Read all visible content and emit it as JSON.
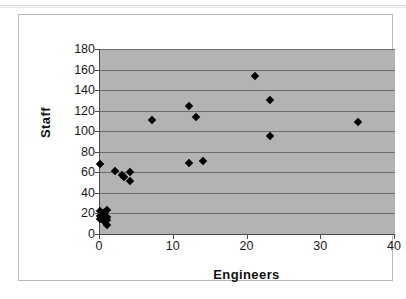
{
  "chart_data": {
    "type": "scatter",
    "title": "",
    "xlabel": "Engineers",
    "ylabel": "Staff",
    "xlim": [
      0,
      40
    ],
    "ylim": [
      0,
      180
    ],
    "xticks": [
      0,
      10,
      20,
      30,
      40
    ],
    "yticks": [
      0,
      20,
      40,
      60,
      80,
      100,
      120,
      140,
      160,
      180
    ],
    "grid": "horizontal",
    "legend": "none",
    "plot_background": "#b3b3b3",
    "marker": "diamond",
    "marker_color": "#000000",
    "series": [
      {
        "name": "Organizations",
        "points": [
          {
            "x": 0,
            "y": 68
          },
          {
            "x": 0,
            "y": 22
          },
          {
            "x": 0,
            "y": 18
          },
          {
            "x": 0,
            "y": 15
          },
          {
            "x": 0.4,
            "y": 20
          },
          {
            "x": 0.6,
            "y": 13
          },
          {
            "x": 1,
            "y": 23
          },
          {
            "x": 1,
            "y": 17
          },
          {
            "x": 1,
            "y": 14
          },
          {
            "x": 1,
            "y": 9
          },
          {
            "x": 2,
            "y": 61
          },
          {
            "x": 3,
            "y": 57
          },
          {
            "x": 3.2,
            "y": 55
          },
          {
            "x": 4,
            "y": 60
          },
          {
            "x": 4,
            "y": 52
          },
          {
            "x": 7,
            "y": 111
          },
          {
            "x": 12,
            "y": 125
          },
          {
            "x": 12,
            "y": 69
          },
          {
            "x": 13,
            "y": 114
          },
          {
            "x": 14,
            "y": 71
          },
          {
            "x": 21,
            "y": 154
          },
          {
            "x": 23,
            "y": 130
          },
          {
            "x": 23,
            "y": 95
          },
          {
            "x": 35,
            "y": 109
          }
        ]
      }
    ]
  }
}
